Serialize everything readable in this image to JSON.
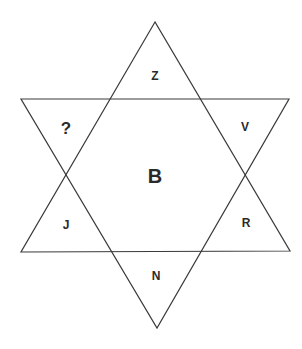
{
  "diagram": {
    "type": "hexagram-letter-puzzle",
    "triangles": {
      "up": {
        "apex": [
          155,
          22
        ],
        "left": [
          21,
          252
        ],
        "right": [
          290,
          251
        ]
      },
      "down": {
        "left": [
          21,
          99
        ],
        "right": [
          289,
          99
        ],
        "apex": [
          157,
          328
        ]
      }
    },
    "labels": {
      "top": {
        "text": "Z",
        "x": 155,
        "y": 76
      },
      "upper_left": {
        "text": "?",
        "x": 66,
        "y": 128
      },
      "upper_right": {
        "text": "V",
        "x": 245,
        "y": 127
      },
      "center": {
        "text": "B",
        "x": 155,
        "y": 176
      },
      "lower_left": {
        "text": "J",
        "x": 66,
        "y": 225
      },
      "lower_right": {
        "text": "R",
        "x": 246,
        "y": 223
      },
      "bottom": {
        "text": "N",
        "x": 156,
        "y": 276
      }
    },
    "colors": {
      "line": "#3a3a3a",
      "text": "#2a2a2a",
      "background": "#ffffff"
    }
  }
}
